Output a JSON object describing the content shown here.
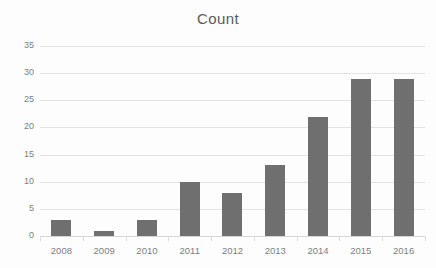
{
  "chart_data": {
    "type": "bar",
    "title": "Count",
    "xlabel": "",
    "ylabel": "",
    "categories": [
      "2008",
      "2009",
      "2010",
      "2011",
      "2012",
      "2013",
      "2014",
      "2015",
      "2016"
    ],
    "values": [
      3,
      1,
      3,
      10,
      8,
      13,
      22,
      29,
      29
    ],
    "ylim": [
      0,
      35
    ],
    "ytick_values": [
      0,
      5,
      10,
      15,
      20,
      25,
      30,
      35
    ],
    "ytick_labels": [
      "0",
      "5",
      "10",
      "15",
      "20",
      "25",
      "30",
      "35"
    ],
    "grid": true,
    "grid_axis": "y",
    "legend": false,
    "legend_position": "none",
    "series": [
      {
        "name": "Count",
        "values": [
          3,
          1,
          3,
          10,
          8,
          13,
          22,
          29,
          29
        ]
      }
    ],
    "colors": {
      "bar": "#706F6F",
      "gridline": "#E3E3E3",
      "baseline": "#D6D6D6",
      "title_text": "#5A5A5A",
      "tick_text": "#7D7D7D",
      "background": "#FDFDFD"
    }
  }
}
